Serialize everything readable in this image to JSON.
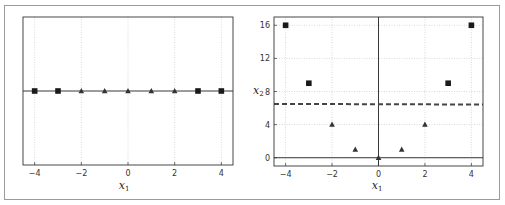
{
  "chart_data": [
    {
      "type": "scatter",
      "title": "",
      "xlabel": "x₁",
      "ylabel": "",
      "xlim": [
        -4.5,
        4.5
      ],
      "ylim": [
        -1,
        1
      ],
      "grid": true,
      "x_ticks": [
        -4,
        -2,
        0,
        2,
        4
      ],
      "x_tick_labels": [
        "−4",
        "−2",
        "0",
        "2",
        "4"
      ],
      "y_ticks": [],
      "axhline": 0,
      "series": [
        {
          "name": "class squares",
          "marker": "square",
          "x": [
            -4,
            -3,
            3,
            4
          ],
          "y": [
            0,
            0,
            0,
            0
          ]
        },
        {
          "name": "class triangles",
          "marker": "triangle",
          "x": [
            -2,
            -1,
            0,
            1,
            2
          ],
          "y": [
            0,
            0,
            0,
            0,
            0
          ]
        }
      ]
    },
    {
      "type": "scatter",
      "title": "",
      "xlabel": "x₁",
      "ylabel": "x₂",
      "xlim": [
        -4.5,
        4.5
      ],
      "ylim": [
        -1,
        17
      ],
      "grid": true,
      "x_ticks": [
        -4,
        -2,
        0,
        2,
        4
      ],
      "x_tick_labels": [
        "−4",
        "−2",
        "0",
        "2",
        "4"
      ],
      "y_ticks": [
        0,
        4,
        8,
        12,
        16
      ],
      "y_tick_labels": [
        "0",
        "4",
        "8",
        "12",
        "16"
      ],
      "axhline": 0,
      "axvline": 0,
      "decision_boundary": {
        "style": "dashed",
        "y": 6.5
      },
      "series": [
        {
          "name": "class squares",
          "marker": "square",
          "x": [
            -4,
            -3,
            3,
            4
          ],
          "y": [
            16,
            9,
            9,
            16
          ]
        },
        {
          "name": "class triangles",
          "marker": "triangle",
          "x": [
            -2,
            -1,
            0,
            1,
            2
          ],
          "y": [
            4,
            1,
            0,
            1,
            4
          ]
        }
      ]
    }
  ],
  "labels": {
    "left_xlabel_main": "x",
    "left_xlabel_sub": "1",
    "right_xlabel_main": "x",
    "right_xlabel_sub": "1",
    "right_ylabel_main": "x",
    "right_ylabel_sub": "2"
  }
}
